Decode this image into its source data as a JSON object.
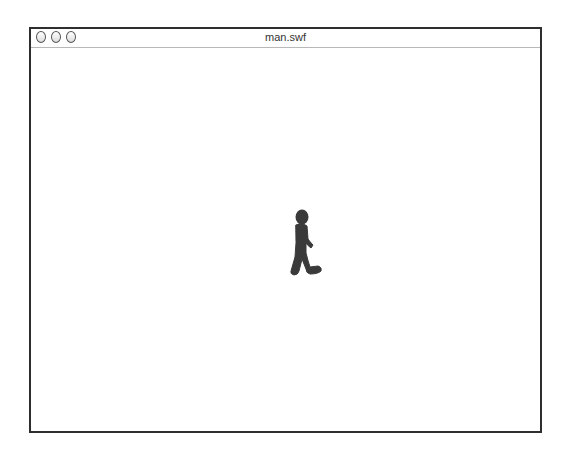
{
  "window": {
    "title": "man.swf",
    "buttons": [
      "close",
      "minimize",
      "zoom"
    ]
  },
  "stage": {
    "content": "walking-man-figure",
    "figure_color": "#3a3a3a"
  }
}
